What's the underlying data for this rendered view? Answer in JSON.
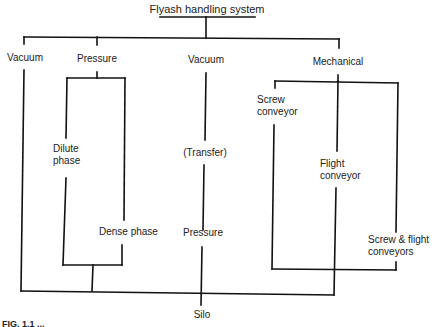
{
  "diagram": {
    "title": "Flyash handling system",
    "branches": {
      "vacuum_left": {
        "label": "Vacuum"
      },
      "pressure": {
        "label": "Pressure",
        "sub": {
          "dilute": "Dilute phase",
          "dilute_line1": "Dilute",
          "dilute_line2": "phase",
          "dense": "Dense phase"
        }
      },
      "vacuum_center": {
        "label": "Vacuum",
        "transfer": "(Transfer)",
        "pressure": "Pressure"
      },
      "mechanical": {
        "label": "Mechanical",
        "sub": {
          "screw_line1": "Screw",
          "screw_line2": "conveyor",
          "flight_line1": "Flight",
          "flight_line2": "conveyor",
          "screw_flight_line1": "Screw & flight",
          "screw_flight_line2": "conveyors"
        }
      }
    },
    "destination": "Silo",
    "caption": "FIG. 1.1 ..."
  },
  "colors": {
    "line": "#111111",
    "text": "#222222",
    "background": "#ffffff"
  }
}
